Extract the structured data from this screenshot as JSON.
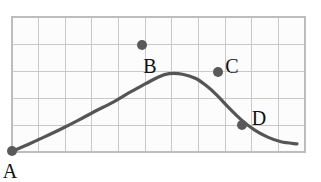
{
  "figure": {
    "background_color": "#ffffff"
  },
  "chart_data": {
    "type": "line",
    "title": "",
    "xlabel": "",
    "ylabel": "",
    "xlim": [
      0,
      11
    ],
    "ylim": [
      0,
      5
    ],
    "grid": true,
    "grid_color": "#c9c9c9",
    "grid_columns": 11,
    "grid_rows": 5,
    "legend": "none",
    "curve_color": "#555555",
    "point_color": "#595959",
    "series": [
      {
        "name": "curve",
        "x": [
          0.0,
          0.6,
          1.2,
          1.9,
          2.5,
          3.1,
          3.8,
          4.4,
          5.0,
          5.5,
          5.9,
          6.4,
          6.9,
          7.3,
          7.7,
          8.1,
          8.6,
          9.1,
          9.6,
          10.1,
          10.7
        ],
        "y": [
          0.02,
          0.28,
          0.55,
          0.88,
          1.18,
          1.5,
          1.85,
          2.2,
          2.52,
          2.78,
          2.9,
          2.88,
          2.72,
          2.45,
          2.1,
          1.68,
          1.2,
          0.82,
          0.55,
          0.38,
          0.3
        ]
      }
    ],
    "points": [
      {
        "label": "A",
        "x": 0.0,
        "y": 0.02,
        "px": 12,
        "py": 151,
        "label_px": 10,
        "label_py": 178,
        "label_anchor": "middle"
      },
      {
        "label": "B",
        "x": 4.9,
        "y": 2.47,
        "px": 142,
        "py": 45,
        "label_px": 150,
        "label_py": 73,
        "label_anchor": "middle"
      },
      {
        "label": "C",
        "x": 7.75,
        "y": 1.92,
        "px": 218,
        "py": 72,
        "label_px": 232,
        "label_py": 73,
        "label_anchor": "middle"
      },
      {
        "label": "D",
        "x": 8.65,
        "y": 0.93,
        "px": 242,
        "py": 125,
        "label_px": 259,
        "label_py": 125,
        "label_anchor": "middle"
      }
    ],
    "axis_box": {
      "left": 12,
      "top": 17,
      "right": 305,
      "bottom": 152
    }
  }
}
